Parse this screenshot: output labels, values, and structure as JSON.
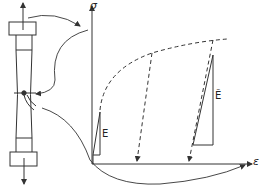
{
  "figure": {
    "colors": {
      "stroke": "#333333",
      "background": "#ffffff"
    }
  },
  "axes": {
    "y_label": "σ",
    "x_label": "ε"
  },
  "labels": {
    "elastic_modulus": "E",
    "damaged_modulus": "Ẽ"
  },
  "specimen": {
    "top_arrow": "arrow-up-icon",
    "bottom_arrow": "arrow-down-icon",
    "extensometer": "extensometer-icon"
  }
}
